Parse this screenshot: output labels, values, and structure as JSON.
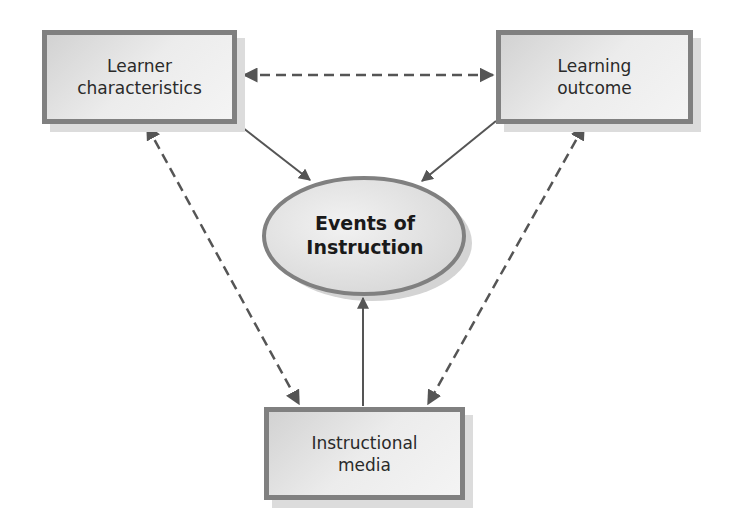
{
  "diagram": {
    "nodes": {
      "learner": {
        "line1": "Learner",
        "line2": "characteristics"
      },
      "outcome": {
        "line1": "Learning",
        "line2": "outcome"
      },
      "events": {
        "line1": "Events of",
        "line2": "Instruction"
      },
      "media": {
        "line1": "Instructional",
        "line2": "media"
      }
    },
    "edges": [
      {
        "from": "Learner characteristics",
        "to": "Learning outcome",
        "style": "dashed",
        "direction": "both"
      },
      {
        "from": "Learner characteristics",
        "to": "Events of Instruction",
        "style": "solid",
        "direction": "forward"
      },
      {
        "from": "Learning outcome",
        "to": "Events of Instruction",
        "style": "solid",
        "direction": "forward"
      },
      {
        "from": "Instructional media",
        "to": "Events of Instruction",
        "style": "solid",
        "direction": "forward"
      },
      {
        "from": "Learner characteristics",
        "to": "Instructional media",
        "style": "dashed",
        "direction": "both"
      },
      {
        "from": "Learning outcome",
        "to": "Instructional media",
        "style": "dashed",
        "direction": "both"
      }
    ],
    "colors": {
      "border": "#808080",
      "arrow": "#555555",
      "fill": "#e6e6e6",
      "text": "#2a2a2a"
    }
  }
}
